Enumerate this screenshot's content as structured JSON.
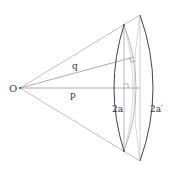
{
  "diagram": {
    "labels": {
      "origin": "O",
      "q": "q",
      "p": "p",
      "inner_chord": "2a",
      "outer_chord": "2a′"
    },
    "colors": {
      "thin_line": "#9a9a9a",
      "arc_line": "#444444",
      "text": "#333333"
    }
  }
}
